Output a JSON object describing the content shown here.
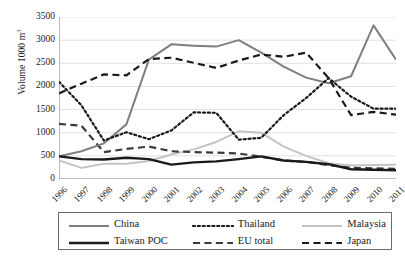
{
  "chart_data": {
    "type": "line",
    "title": "",
    "xlabel": "",
    "ylabel": "Volume 1000 m3",
    "ylabel_prefix": "Volume 1000 m",
    "ylabel_sup": "3",
    "ylim": [
      0,
      3500
    ],
    "ytick_step": 500,
    "grid": true,
    "legend_position": "bottom",
    "categories": [
      "1996",
      "1997",
      "1998",
      "1999",
      "2000",
      "2001",
      "2002",
      "2003",
      "2004",
      "2005",
      "2006",
      "2007",
      "2008",
      "2009",
      "2010",
      "2011"
    ],
    "yticks": [
      "3500",
      "3000",
      "2500",
      "2000",
      "1500",
      "1000",
      "500",
      "0"
    ],
    "series": [
      {
        "name": "China",
        "color": "#7f7f7f",
        "style": "solid",
        "width": 2.0,
        "values": [
          490,
          600,
          770,
          1180,
          2580,
          2910,
          2880,
          2860,
          3000,
          2730,
          2430,
          2190,
          2070,
          2220,
          3320,
          2580
        ]
      },
      {
        "name": "Thailand",
        "color": "#1a1a1a",
        "style": "dotted",
        "width": 2.2,
        "values": [
          2100,
          1590,
          830,
          1010,
          860,
          1050,
          1440,
          1430,
          850,
          890,
          1380,
          1750,
          2180,
          1780,
          1520,
          1520
        ]
      },
      {
        "name": "Malaysia",
        "color": "#c4c4c4",
        "style": "solid",
        "width": 2.0,
        "values": [
          400,
          240,
          330,
          330,
          390,
          530,
          640,
          800,
          1030,
          1000,
          700,
          500,
          340,
          290,
          300,
          310
        ]
      },
      {
        "name": "Taiwan POC",
        "color": "#1a1a1a",
        "style": "solid",
        "width": 2.4,
        "values": [
          490,
          430,
          420,
          460,
          430,
          310,
          360,
          380,
          430,
          490,
          400,
          370,
          320,
          210,
          200,
          190
        ]
      },
      {
        "name": "EU total",
        "color": "#3a3a3a",
        "style": "dashed",
        "width": 2.2,
        "values": [
          1190,
          1150,
          580,
          650,
          700,
          600,
          580,
          570,
          550,
          480,
          400,
          370,
          300,
          240,
          230,
          220
        ]
      },
      {
        "name": "Japan",
        "color": "#1a1a1a",
        "style": "dashed",
        "width": 2.2,
        "values": [
          1850,
          2060,
          2260,
          2240,
          2590,
          2620,
          2510,
          2400,
          2560,
          2690,
          2640,
          2730,
          2180,
          1380,
          1450,
          1390
        ]
      }
    ]
  },
  "legend": {
    "row1": [
      {
        "label": "China",
        "series": "China"
      },
      {
        "label": "Thailand",
        "series": "Thailand"
      },
      {
        "label": "Malaysia",
        "series": "Malaysia"
      }
    ],
    "row2": [
      {
        "label": "Taiwan POC",
        "series": "Taiwan POC"
      },
      {
        "label": "EU total",
        "series": "EU total"
      },
      {
        "label": "Japan",
        "series": "Japan"
      }
    ]
  }
}
